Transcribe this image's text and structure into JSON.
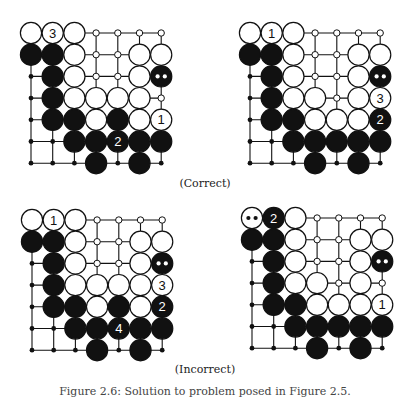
{
  "figure": {
    "group_labels": {
      "correct": "(Correct)",
      "incorrect": "(Incorrect)"
    },
    "figure_caption": "Figure 2.6: Solution to problem posed in Figure 2.5."
  },
  "legend": {
    "W": "white stone",
    "B": "black stone",
    "o": "empty point (white territory, hollow marker)",
    ".": "empty point (black territory, dot marker)",
    "BM": "black stone marked with two white dots",
    "WM": "white stone marked with two black dots"
  },
  "boards": [
    {
      "id": "correct-1",
      "group": "correct",
      "grid": [
        [
          "W",
          "W",
          "W",
          "o",
          "o",
          "o",
          "o"
        ],
        [
          "B",
          "B",
          "W",
          "o",
          "o",
          "W",
          "W"
        ],
        [
          ".",
          "B",
          "W",
          "o",
          "o",
          "W",
          "BM"
        ],
        [
          ".",
          "B",
          "W",
          "W",
          "W",
          "W",
          "o"
        ],
        [
          ".",
          "B",
          "B",
          "W",
          "B",
          "W",
          "W"
        ],
        [
          ".",
          ".",
          "B",
          "B",
          "B",
          "B",
          "B"
        ],
        [
          ".",
          ".",
          ".",
          "B",
          ".",
          "B",
          "."
        ]
      ],
      "move_numbers": [
        {
          "row": 4,
          "col": 6,
          "n": "1"
        },
        {
          "row": 5,
          "col": 4,
          "n": "2"
        },
        {
          "row": 0,
          "col": 1,
          "n": "3"
        }
      ]
    },
    {
      "id": "correct-2",
      "group": "correct",
      "grid": [
        [
          "W",
          "W",
          "W",
          "o",
          "o",
          "o",
          "o"
        ],
        [
          "B",
          "B",
          "W",
          "o",
          "o",
          "W",
          "W"
        ],
        [
          ".",
          "B",
          "W",
          "o",
          "o",
          "W",
          "BM"
        ],
        [
          ".",
          "B",
          "W",
          "W",
          "o",
          "W",
          "W"
        ],
        [
          ".",
          "B",
          "B",
          "W",
          "W",
          "W",
          "B"
        ],
        [
          ".",
          ".",
          "B",
          "B",
          "B",
          "B",
          "B"
        ],
        [
          ".",
          ".",
          ".",
          "B",
          ".",
          "B",
          "."
        ]
      ],
      "move_numbers": [
        {
          "row": 0,
          "col": 1,
          "n": "1"
        },
        {
          "row": 4,
          "col": 6,
          "n": "2"
        },
        {
          "row": 3,
          "col": 6,
          "n": "3"
        }
      ]
    },
    {
      "id": "incorrect-1",
      "group": "incorrect",
      "grid": [
        [
          "W",
          "W",
          "W",
          "o",
          "o",
          "o",
          "o"
        ],
        [
          "B",
          "B",
          "W",
          "o",
          "o",
          "W",
          "W"
        ],
        [
          ".",
          "B",
          "W",
          "o",
          "o",
          "W",
          "BM"
        ],
        [
          ".",
          "B",
          "W",
          "W",
          "W",
          "W",
          "W"
        ],
        [
          ".",
          "B",
          "B",
          "W",
          "B",
          "W",
          "B"
        ],
        [
          ".",
          ".",
          "B",
          "B",
          "B",
          "B",
          "B"
        ],
        [
          ".",
          ".",
          ".",
          "B",
          ".",
          "B",
          "."
        ]
      ],
      "move_numbers": [
        {
          "row": 0,
          "col": 1,
          "n": "1"
        },
        {
          "row": 4,
          "col": 6,
          "n": "2"
        },
        {
          "row": 3,
          "col": 6,
          "n": "3"
        },
        {
          "row": 5,
          "col": 4,
          "n": "4"
        }
      ]
    },
    {
      "id": "incorrect-2",
      "group": "incorrect",
      "grid": [
        [
          "WM",
          "B",
          "W",
          "o",
          "o",
          "o",
          "o"
        ],
        [
          "B",
          "B",
          "W",
          "o",
          "o",
          "W",
          "W"
        ],
        [
          ".",
          "B",
          "W",
          "o",
          "o",
          "W",
          "BM"
        ],
        [
          ".",
          "B",
          "W",
          "W",
          "o",
          "W",
          "o"
        ],
        [
          ".",
          "B",
          "B",
          "W",
          "W",
          "W",
          "W"
        ],
        [
          ".",
          ".",
          "B",
          "B",
          "B",
          "B",
          "B"
        ],
        [
          ".",
          ".",
          ".",
          "B",
          ".",
          "B",
          "."
        ]
      ],
      "move_numbers": [
        {
          "row": 4,
          "col": 6,
          "n": "1"
        },
        {
          "row": 0,
          "col": 1,
          "n": "2"
        }
      ]
    }
  ]
}
